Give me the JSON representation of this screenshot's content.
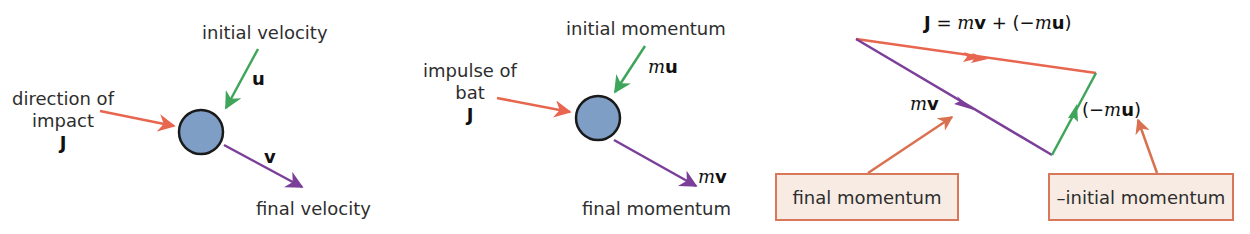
{
  "colors": {
    "impulse": "#e8654f",
    "initial": "#3fa55a",
    "final": "#7b3f9a",
    "ball_fill": "#7f9ec6",
    "ball_stroke": "#1a1a1a",
    "callout_fill": "#f7ebe3",
    "callout_border": "#d9775a",
    "callout_arrow": "#d9704f"
  },
  "panel1": {
    "initial_label": "initial velocity",
    "initial_symbol": "u",
    "impact_label_line1": "direction of",
    "impact_label_line2": "impact",
    "impact_symbol": "J",
    "final_symbol": "v",
    "final_label": "final velocity"
  },
  "panel2": {
    "initial_label": "initial momentum",
    "initial_symbol_m": "m",
    "initial_symbol_vec": "u",
    "impulse_label_line1": "impulse of",
    "impulse_label_line2": "bat",
    "impulse_symbol": "J",
    "final_symbol_m": "m",
    "final_symbol_vec": "v",
    "final_label": "final momentum"
  },
  "panel3": {
    "equation": {
      "lhs": "J",
      "eq": " = ",
      "m1": "m",
      "v": "v",
      "plus": " + (−",
      "m2": "m",
      "u": "u",
      "close": ")"
    },
    "mv_m": "m",
    "mv_v": "v",
    "neg_mu_open": "(−",
    "neg_mu_m": "m",
    "neg_mu_u": "u",
    "neg_mu_close": ")",
    "callout_final": "final momentum",
    "callout_neg_initial": "–initial momentum"
  }
}
